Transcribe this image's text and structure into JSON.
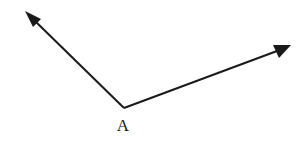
{
  "figure": {
    "title": "Angle with vertex A and two rays",
    "background_color": "#ffffff",
    "stroke_color": "#1a1a1a",
    "stroke_width": 2,
    "width": 304,
    "height": 144
  },
  "vertex": {
    "label": "A",
    "x": 124,
    "y": 108,
    "label_x": 123,
    "label_y": 131,
    "label_font_size": 17
  },
  "rays": [
    {
      "name": "ray-upper-left",
      "from_x": 124,
      "from_y": 108,
      "to_x": 25,
      "to_y": 11,
      "line_end_x": 35,
      "line_end_y": 21,
      "arrow_points": "25,11 41,19 33,27",
      "direction": "up-left",
      "arrow": true
    },
    {
      "name": "ray-upper-right",
      "from_x": 124,
      "from_y": 108,
      "to_x": 291,
      "to_y": 45,
      "line_end_x": 277,
      "line_end_y": 51,
      "arrow_points": "291,45 273,45 279,58",
      "direction": "up-right",
      "arrow": true
    }
  ]
}
